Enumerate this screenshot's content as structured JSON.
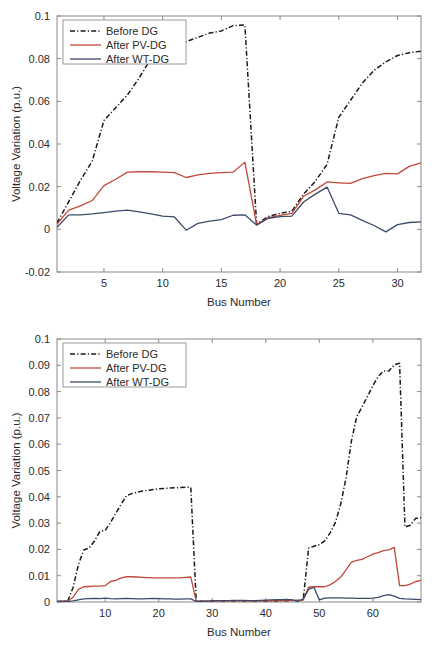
{
  "figure": {
    "panels": [
      {
        "name": "top-panel",
        "axis": {
          "xlabel": "Bus Number",
          "ylabel": "Voltage Variation (p.u.)",
          "xticks": [
            "5",
            "10",
            "15",
            "20",
            "25",
            "30"
          ],
          "yticks": [
            "-0.02",
            "0",
            "0.02",
            "0.04",
            "0.06",
            "0.08",
            "0.1"
          ]
        },
        "legend": {
          "items": [
            {
              "label": "Before DG",
              "style": "dash-dot",
              "color": "#1a1a1a"
            },
            {
              "label": "After PV-DG",
              "style": "solid",
              "color": "#c0493a"
            },
            {
              "label": "After WT-DG",
              "style": "solid",
              "color": "#3d4a69"
            }
          ]
        }
      },
      {
        "name": "bottom-panel",
        "axis": {
          "xlabel": "Bus Number",
          "ylabel": "Voltage Variation (p.u.)",
          "xticks": [
            "10",
            "20",
            "30",
            "40",
            "50",
            "60"
          ],
          "yticks": [
            "0",
            "0.01",
            "0.02",
            "0.03",
            "0.04",
            "0.05",
            "0.06",
            "0.07",
            "0.08",
            "0.09",
            "0.1"
          ]
        },
        "legend": {
          "items": [
            {
              "label": "Before DG",
              "style": "dash-dot",
              "color": "#1a1a1a"
            },
            {
              "label": "After PV-DG",
              "style": "solid",
              "color": "#c0493a"
            },
            {
              "label": "After WT-DG",
              "style": "solid",
              "color": "#3d4a69"
            }
          ]
        }
      }
    ]
  },
  "chart_data": [
    {
      "type": "line",
      "name": "top-panel",
      "title": "",
      "xlabel": "Bus Number",
      "ylabel": "Voltage Variation (p.u.)",
      "xlim": [
        1,
        32
      ],
      "ylim": [
        -0.02,
        0.1
      ],
      "xticks": [
        5,
        10,
        15,
        20,
        25,
        30
      ],
      "yticks": [
        -0.02,
        0,
        0.02,
        0.04,
        0.06,
        0.08,
        0.1
      ],
      "grid": false,
      "legend_position": "top-left",
      "x": [
        1,
        2,
        3,
        4,
        5,
        6,
        7,
        8,
        9,
        10,
        11,
        12,
        13,
        14,
        15,
        16,
        17,
        18,
        19,
        20,
        21,
        22,
        23,
        24,
        25,
        26,
        27,
        28,
        29,
        30,
        31,
        32
      ],
      "series": [
        {
          "name": "Before DG",
          "color": "#1a1a1a",
          "style": "dash-dot",
          "values": [
            0.003,
            0.013,
            0.023,
            0.032,
            0.051,
            0.057,
            0.063,
            0.071,
            0.08,
            0.082,
            0.085,
            0.088,
            0.09,
            0.092,
            0.093,
            0.0955,
            0.0958,
            0.0025,
            0.006,
            0.0075,
            0.0085,
            0.0165,
            0.0225,
            0.0305,
            0.0525,
            0.0605,
            0.0685,
            0.0745,
            0.0785,
            0.0815,
            0.0828,
            0.0835
          ]
        },
        {
          "name": "After PV-DG",
          "color": "#c0493a",
          "style": "solid",
          "values": [
            0.0025,
            0.009,
            0.011,
            0.0135,
            0.0205,
            0.0235,
            0.0268,
            0.027,
            0.027,
            0.0268,
            0.0266,
            0.0243,
            0.0255,
            0.0262,
            0.0266,
            0.0268,
            0.0315,
            0.0022,
            0.0055,
            0.0065,
            0.0075,
            0.0155,
            0.0185,
            0.0222,
            0.0218,
            0.0215,
            0.0238,
            0.0252,
            0.0262,
            0.026,
            0.0295,
            0.0312
          ]
        },
        {
          "name": "After WT-DG",
          "color": "#3d4a69",
          "style": "solid",
          "values": [
            0.001,
            0.0068,
            0.0068,
            0.0072,
            0.0078,
            0.0085,
            0.009,
            0.0082,
            0.0072,
            0.0062,
            0.0058,
            -0.0004,
            0.0028,
            0.0038,
            0.0046,
            0.0066,
            0.0068,
            0.002,
            0.0052,
            0.006,
            0.0062,
            0.0128,
            0.0165,
            0.0198,
            0.0075,
            0.0068,
            0.0042,
            0.0018,
            -0.0012,
            0.0022,
            0.0032,
            0.0035
          ]
        }
      ]
    },
    {
      "type": "line",
      "name": "bottom-panel",
      "title": "",
      "xlabel": "Bus Number",
      "ylabel": "Voltage Variation (p.u.)",
      "xlim": [
        1,
        69
      ],
      "ylim": [
        0,
        0.1
      ],
      "xticks": [
        10,
        20,
        30,
        40,
        50,
        60
      ],
      "yticks": [
        0,
        0.01,
        0.02,
        0.03,
        0.04,
        0.05,
        0.06,
        0.07,
        0.08,
        0.09,
        0.1
      ],
      "grid": false,
      "legend_position": "top-left",
      "x": [
        1,
        2,
        3,
        4,
        5,
        6,
        7,
        8,
        9,
        10,
        11,
        12,
        13,
        14,
        15,
        16,
        17,
        18,
        19,
        20,
        21,
        22,
        23,
        24,
        25,
        26,
        27,
        28,
        29,
        30,
        31,
        32,
        33,
        34,
        35,
        36,
        37,
        38,
        39,
        40,
        41,
        42,
        43,
        44,
        45,
        46,
        47,
        48,
        49,
        50,
        51,
        52,
        53,
        54,
        55,
        56,
        57,
        58,
        59,
        60,
        61,
        62,
        63,
        64,
        65,
        66,
        67,
        68,
        69
      ],
      "series": [
        {
          "name": "Before DG",
          "color": "#1a1a1a",
          "style": "dash-dot",
          "values": [
            0.0002,
            0.0003,
            0.0004,
            0.0055,
            0.0142,
            0.0198,
            0.0205,
            0.0232,
            0.0268,
            0.0272,
            0.0302,
            0.0338,
            0.0372,
            0.0405,
            0.0412,
            0.0418,
            0.0422,
            0.0425,
            0.0428,
            0.043,
            0.0432,
            0.0433,
            0.0434,
            0.0435,
            0.0436,
            0.0436,
            0.0005,
            0.0003,
            0.0003,
            0.0004,
            0.0004,
            0.0004,
            0.0004,
            0.0004,
            0.0004,
            0.0004,
            0.0004,
            0.0004,
            0.0004,
            0.0004,
            0.0004,
            0.0004,
            0.0005,
            0.0005,
            0.0006,
            0.0006,
            0.0008,
            0.0205,
            0.0212,
            0.0218,
            0.0232,
            0.0262,
            0.0302,
            0.0372,
            0.0472,
            0.0612,
            0.0705,
            0.0742,
            0.0782,
            0.0822,
            0.0858,
            0.0878,
            0.0878,
            0.0902,
            0.0908,
            0.0285,
            0.0292,
            0.0318,
            0.032
          ]
        },
        {
          "name": "After PV-DG",
          "color": "#c0493a",
          "style": "solid",
          "values": [
            0.0002,
            0.0003,
            0.0004,
            0.0018,
            0.0048,
            0.0058,
            0.0059,
            0.006,
            0.006,
            0.0062,
            0.0078,
            0.0082,
            0.0092,
            0.0096,
            0.0096,
            0.0095,
            0.0094,
            0.0093,
            0.0092,
            0.0092,
            0.0092,
            0.0092,
            0.0092,
            0.0092,
            0.0094,
            0.0095,
            0.0003,
            0.0003,
            0.0003,
            0.0004,
            0.0004,
            0.0004,
            0.0004,
            0.0004,
            0.0004,
            0.0004,
            0.0004,
            0.0004,
            0.0004,
            0.0004,
            0.0004,
            0.0004,
            0.0005,
            0.0005,
            0.0006,
            0.0006,
            0.0008,
            0.0056,
            0.0058,
            0.0058,
            0.0058,
            0.0065,
            0.0078,
            0.0095,
            0.0122,
            0.0152,
            0.0158,
            0.0162,
            0.0172,
            0.0182,
            0.0188,
            0.0195,
            0.0198,
            0.0208,
            0.0062,
            0.0062,
            0.0068,
            0.0078,
            0.0082
          ]
        },
        {
          "name": "After WT-DG",
          "color": "#3d4a69",
          "style": "solid",
          "values": [
            0.0001,
            0.0002,
            0.0002,
            0.0004,
            0.0008,
            0.0012,
            0.0013,
            0.0014,
            0.0013,
            0.0015,
            0.0013,
            0.0012,
            0.0013,
            0.0014,
            0.0013,
            0.0012,
            0.0012,
            0.0013,
            0.0014,
            0.0013,
            0.0012,
            0.0012,
            0.0011,
            0.0011,
            0.0012,
            0.0012,
            0.0002,
            0.0002,
            0.0003,
            0.0004,
            0.0005,
            0.0005,
            0.0005,
            0.0006,
            0.0006,
            0.0006,
            0.0005,
            0.0005,
            0.0006,
            0.0007,
            0.0008,
            0.0009,
            0.0009,
            0.001,
            0.0008,
            0.0002,
            0.0012,
            0.0048,
            0.0056,
            0.0008,
            0.0015,
            0.0016,
            0.0016,
            0.0016,
            0.0015,
            0.0015,
            0.0014,
            0.0014,
            0.0014,
            0.0015,
            0.0018,
            0.0024,
            0.0028,
            0.0022,
            0.0014,
            0.0012,
            0.0011,
            0.001,
            0.0009
          ]
        }
      ]
    }
  ]
}
